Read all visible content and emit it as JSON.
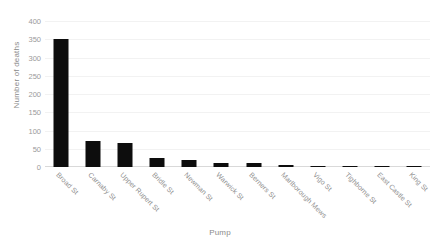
{
  "chart_data": {
    "type": "bar",
    "title": "",
    "xlabel": "Pump",
    "ylabel": "Number of deaths",
    "ylim": [
      0,
      400
    ],
    "yticks": [
      0,
      50,
      100,
      150,
      200,
      250,
      300,
      350,
      400
    ],
    "grid": true,
    "legend": false,
    "bar_color": "#0d0d0d",
    "text_color": "#8e8e8e",
    "background": "#ffffff",
    "categories": [
      "Broad St",
      "Carnaby St",
      "Upper Rupert St",
      "Bridle St",
      "Newman St",
      "Warwick St",
      "Berners St",
      "Marlborough Mews",
      "Vigo St",
      "Tighborne St",
      "East Castle St",
      "King St"
    ],
    "values": [
      350,
      70,
      65,
      25,
      20,
      12,
      12,
      6,
      3,
      2,
      1,
      1
    ]
  }
}
